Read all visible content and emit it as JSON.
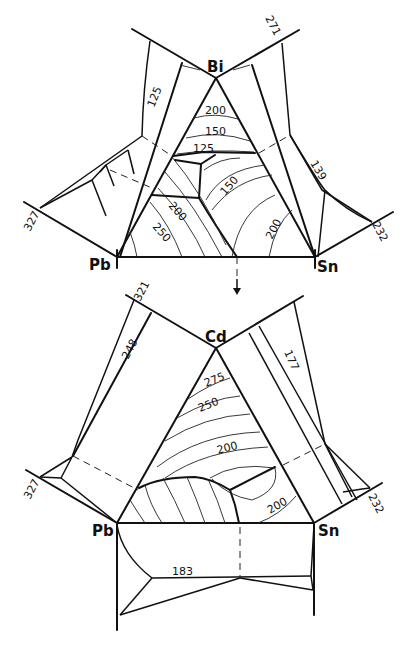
{
  "figure": {
    "top_diagram": {
      "system": "Bi-Pb-Sn",
      "vertices": {
        "top": "Bi",
        "left": "Pb",
        "right": "Sn"
      },
      "binary_melting_points": {
        "Pb": "327",
        "Sn": "232",
        "Bi": "271"
      },
      "binary_eutectics": {
        "Pb-Bi": "125",
        "Bi-Sn": "139"
      },
      "isotherm_labels": [
        "200",
        "150",
        "125",
        "150",
        "200",
        "250",
        "200"
      ]
    },
    "arrow": "down-arrow",
    "bottom_diagram": {
      "system": "Cd-Pb-Sn",
      "vertices": {
        "top": "Cd",
        "left": "Pb",
        "right": "Sn"
      },
      "binary_melting_points": {
        "Pb": "327",
        "Sn": "232",
        "Cd": "321"
      },
      "binary_eutectics": {
        "Pb-Cd": "248",
        "Cd-Sn": "177",
        "Pb-Sn": "183"
      },
      "isotherm_labels": [
        "275",
        "250",
        "200",
        "200"
      ]
    }
  },
  "labels": {
    "bi": "Bi",
    "pb_top": "Pb",
    "sn_top": "Sn",
    "cd": "Cd",
    "pb_bot": "Pb",
    "sn_bot": "Sn",
    "t327_top": "327",
    "t232_top": "232",
    "t271": "271",
    "t125_side": "125",
    "t139": "139",
    "iso200_a": "200",
    "iso150_a": "150",
    "iso125": "125",
    "iso150_b": "150",
    "iso200_b": "200",
    "iso250": "250",
    "iso200_c": "200",
    "t327_bot": "327",
    "t232_bot": "232",
    "t321": "321",
    "t248": "248",
    "t177": "177",
    "t183": "183",
    "iso275": "275",
    "iso250_b": "250",
    "iso200_d": "200",
    "iso200_e": "200"
  }
}
